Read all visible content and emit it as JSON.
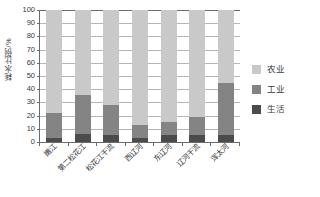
{
  "chart_data": {
    "type": "bar",
    "title": "",
    "subtitle": "",
    "xlabel": "",
    "ylabel": "耗水比例/%",
    "ylim": [
      0,
      100
    ],
    "yticks": [
      0,
      10,
      20,
      30,
      40,
      50,
      60,
      70,
      80,
      90,
      100
    ],
    "grid": true,
    "stacked": true,
    "legend_position": "right",
    "categories": [
      "嫩江",
      "第二松花江",
      "松花江干流",
      "西辽河",
      "东辽河",
      "辽河干流",
      "浑太河"
    ],
    "series": [
      {
        "name": "生活",
        "color": "#4b4b4b",
        "values": [
          3,
          6,
          5,
          3,
          5,
          5,
          5
        ]
      },
      {
        "name": "工业",
        "color": "#848484",
        "values": [
          19,
          30,
          23,
          10,
          10,
          14,
          40
        ]
      },
      {
        "name": "农业",
        "color": "#c9c9c9",
        "values": [
          78,
          64,
          72,
          87,
          85,
          81,
          55
        ]
      }
    ],
    "series_cumulative_tops": {
      "生活": [
        3,
        6,
        5,
        3,
        5,
        5,
        5
      ],
      "工业": [
        22,
        36,
        28,
        13,
        15,
        19,
        45
      ],
      "农业": [
        100,
        100,
        100,
        100,
        100,
        100,
        100
      ]
    }
  },
  "legend": {
    "items": [
      {
        "label": "农业",
        "color": "#c9c9c9"
      },
      {
        "label": "工业",
        "color": "#848484"
      },
      {
        "label": "生活",
        "color": "#4b4b4b"
      }
    ]
  },
  "axis": {
    "y_title": "耗水比例/%",
    "y_tick_labels": [
      "100",
      "90",
      "80",
      "70",
      "60",
      "50",
      "40",
      "30",
      "20",
      "10",
      "0"
    ]
  }
}
